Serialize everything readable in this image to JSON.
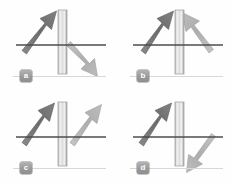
{
  "figure": {
    "type": "vector-diagram-grid",
    "columns": 2,
    "rows": 2,
    "background_color": "#fefefe",
    "panels": [
      {
        "id": "a",
        "label": "a",
        "barrier": {
          "name": "vertical-slab",
          "orientation": "vertical",
          "x": 58,
          "top": 10,
          "bottom": 74,
          "width": 9,
          "fill_light": "#f2f2f2",
          "fill_edge": "#a8a8a8"
        },
        "axis": {
          "name": "horizontal-axis",
          "y": 45,
          "x_start": 16,
          "x_end": 106,
          "color": "#4d4d4d"
        },
        "arrows": [
          {
            "name": "incident-arrow",
            "tone": "dark",
            "color": "#6e6e6e",
            "x1": 24,
            "y1": 47,
            "x2": 52,
            "y2": 14,
            "direction": "up-right"
          },
          {
            "name": "outgoing-arrow",
            "tone": "light",
            "color": "#b2b2b2",
            "x1": 72,
            "y1": 44,
            "x2": 98,
            "y2": 74,
            "direction": "down-right"
          }
        ]
      },
      {
        "id": "b",
        "label": "b",
        "barrier": {
          "name": "vertical-slab",
          "orientation": "vertical",
          "x": 58,
          "top": 10,
          "bottom": 74,
          "width": 9,
          "fill_light": "#f2f2f2",
          "fill_edge": "#a8a8a8"
        },
        "axis": {
          "name": "horizontal-axis",
          "y": 45,
          "x_start": 16,
          "x_end": 106,
          "color": "#4d4d4d"
        },
        "arrows": [
          {
            "name": "incident-arrow",
            "tone": "dark",
            "color": "#6e6e6e",
            "x1": 26,
            "y1": 47,
            "x2": 52,
            "y2": 14,
            "direction": "up-right"
          },
          {
            "name": "outgoing-arrow",
            "tone": "light",
            "color": "#b2b2b2",
            "x1": 94,
            "y1": 46,
            "x2": 70,
            "y2": 14,
            "direction": "up-left"
          }
        ]
      },
      {
        "id": "c",
        "label": "c",
        "barrier": {
          "name": "vertical-slab",
          "orientation": "vertical",
          "x": 58,
          "top": 10,
          "bottom": 74,
          "width": 9,
          "fill_light": "#f2f2f2",
          "fill_edge": "#a8a8a8"
        },
        "axis": {
          "name": "horizontal-axis",
          "y": 45,
          "x_start": 16,
          "x_end": 106,
          "color": "#4d4d4d"
        },
        "arrows": [
          {
            "name": "incident-arrow",
            "tone": "dark",
            "color": "#6e6e6e",
            "x1": 24,
            "y1": 47,
            "x2": 50,
            "y2": 14,
            "direction": "up-right"
          },
          {
            "name": "outgoing-arrow",
            "tone": "light",
            "color": "#b2b2b2",
            "x1": 72,
            "y1": 47,
            "x2": 98,
            "y2": 14,
            "direction": "up-right"
          }
        ]
      },
      {
        "id": "d",
        "label": "d",
        "barrier": {
          "name": "vertical-slab",
          "orientation": "vertical",
          "x": 58,
          "top": 10,
          "bottom": 74,
          "width": 9,
          "fill_light": "#f2f2f2",
          "fill_edge": "#a8a8a8"
        },
        "axis": {
          "name": "horizontal-axis",
          "y": 45,
          "x_start": 16,
          "x_end": 106,
          "color": "#4d4d4d"
        },
        "arrows": [
          {
            "name": "incident-arrow",
            "tone": "dark",
            "color": "#6e6e6e",
            "x1": 24,
            "y1": 47,
            "x2": 50,
            "y2": 14,
            "direction": "up-right"
          },
          {
            "name": "outgoing-arrow",
            "tone": "light",
            "color": "#b2b2b2",
            "x1": 92,
            "y1": 44,
            "x2": 70,
            "y2": 76,
            "direction": "down-left"
          }
        ]
      }
    ],
    "caption_rule_color": "#d8d8d8",
    "badge_text_color": "#ffffff",
    "badge_fill_color": "#9a9a9a"
  }
}
